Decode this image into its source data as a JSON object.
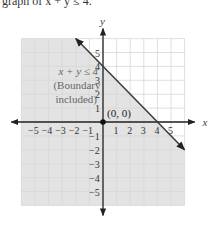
{
  "caption": "graph of x + y ≤ 4.",
  "chart_data": {
    "type": "area",
    "title": "",
    "xlabel": "x",
    "ylabel": "y",
    "xlim": [
      -6,
      6
    ],
    "ylim": [
      -6,
      6
    ],
    "grid": true,
    "x_ticks": [
      -5,
      -4,
      -3,
      -2,
      -1,
      1,
      2,
      3,
      4,
      5
    ],
    "y_ticks": [
      -5,
      -4,
      -3,
      -2,
      -1,
      1,
      2,
      3,
      4,
      5
    ],
    "x_tick_labels": [
      "−5",
      "−4",
      "−3",
      "−2",
      "−1",
      "1",
      "2",
      "3",
      "4",
      "5"
    ],
    "y_tick_labels": [
      "−5",
      "−4",
      "−3",
      "−2",
      "−1",
      "1",
      "2",
      "3",
      "4",
      "5"
    ],
    "boundary_line": {
      "equation": "x + y = 4",
      "points": [
        [
          -2,
          6
        ],
        [
          6,
          -2
        ]
      ],
      "style": "solid",
      "x_intercept": 4,
      "y_intercept": 4
    },
    "shaded_region": "below boundary line (x + y ≤ 4)",
    "region_label": [
      "x + y ≤ 4",
      "(Boundary",
      "included)"
    ],
    "test_point": {
      "x": 0,
      "y": 0,
      "label": "(0, 0)"
    }
  },
  "colors": {
    "shade": "#e3e3e3",
    "grid_shaded": "#bdbdbd",
    "grid_unshaded": "#d8d8d8",
    "axis": "#222222",
    "boundary": "#3a3a3a"
  }
}
